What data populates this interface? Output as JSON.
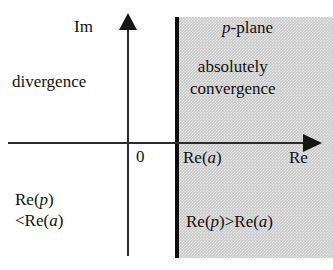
{
  "figure": {
    "axes": {
      "imaginary_label": "Im",
      "real_label": "Re",
      "origin_label": "0",
      "boundary_label": "Re(a)",
      "boundary_label_prefix": "Re(",
      "boundary_label_var": "a",
      "boundary_label_suffix": ")"
    },
    "regions": {
      "left": {
        "name": "divergence",
        "label": "divergence",
        "condition_line1_prefix": "Re(",
        "condition_line1_var": "p",
        "condition_line1_suffix": ")",
        "condition_line2_prefix": "<Re(",
        "condition_line2_var": "a",
        "condition_line2_suffix": ")"
      },
      "right": {
        "name": "absolutely convergence",
        "label_line1": "absolutely",
        "label_line2": "convergence",
        "plane_label_var": "p",
        "plane_label_suffix": "-plane",
        "condition_prefix": "Re(",
        "condition_var1": "p",
        "condition_mid": ")>Re(",
        "condition_var2": "a",
        "condition_suffix": ")"
      }
    },
    "colors": {
      "background": "#ffffff",
      "shade": "#c9c9c9",
      "ink": "#111111",
      "boundary": "#0d0d0d"
    }
  }
}
